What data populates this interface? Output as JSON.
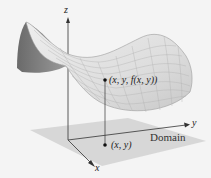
{
  "figure": {
    "type": "3d-surface-diagram",
    "axes": {
      "x_label": "x",
      "y_label": "y",
      "z_label": "z"
    },
    "labels": {
      "surface_point": "(x, y, f(x, y))",
      "domain_point": "(x, y)",
      "domain": "Domain"
    },
    "colors": {
      "background": "#f4f4f4",
      "surface_light": "#e2e2e2",
      "surface_dark": "#8a8a8a",
      "grid": "#a8a8a8",
      "domain_plane": "#d6d6d6",
      "axis": "#333333"
    }
  }
}
